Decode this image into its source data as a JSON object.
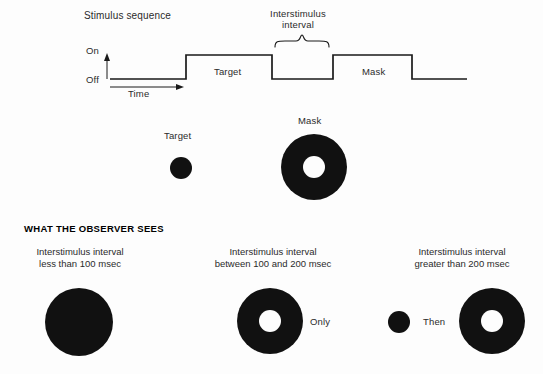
{
  "figure": {
    "title": "Stimulus sequence",
    "background_color": "#fdfdfd",
    "ink_color": "#111111"
  },
  "stimulus_sequence": {
    "title": "Stimulus sequence",
    "axis": {
      "on_label": "On",
      "off_label": "Off",
      "time_label": "Time"
    },
    "interstimulus_brace_label": "Interstimulus\ninterval",
    "interstimulus_brace_line1": "Interstimulus",
    "interstimulus_brace_line2": "interval",
    "pulses": [
      {
        "name": "Target",
        "label": "Target"
      },
      {
        "name": "Mask",
        "label": "Mask"
      }
    ]
  },
  "stimuli": {
    "target": {
      "label": "Target",
      "shape": "filled-disk",
      "outer_diameter": 22
    },
    "mask": {
      "label": "Mask",
      "shape": "annulus",
      "outer_diameter": 66,
      "inner_diameter": 22
    }
  },
  "observer_section": {
    "heading": "WHAT THE OBSERVER SEES",
    "conditions": [
      {
        "id": "isi-less-than-100",
        "caption_line1": "Interstimulus interval",
        "caption_line2": "less than 100 msec",
        "percept": "single-large-disk",
        "connector_label": ""
      },
      {
        "id": "isi-100-to-200",
        "caption_line1": "Interstimulus interval",
        "caption_line2": "between 100 and 200 msec",
        "percept": "annulus-only",
        "connector_label": "Only"
      },
      {
        "id": "isi-greater-than-200",
        "caption_line1": "Interstimulus interval",
        "caption_line2": "greater than 200 msec",
        "percept": "disk-then-annulus",
        "connector_label": "Then"
      }
    ]
  }
}
